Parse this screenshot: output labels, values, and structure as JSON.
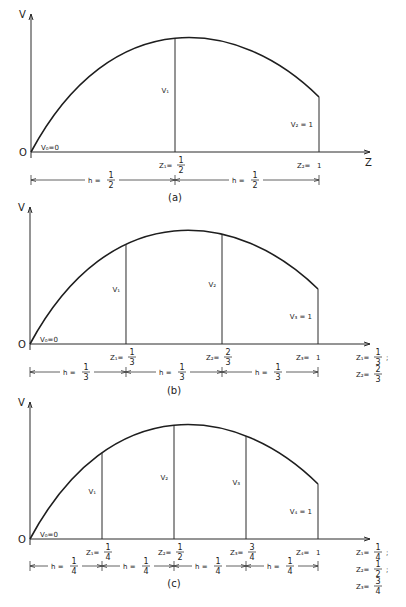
{
  "figure": {
    "caption": "",
    "panels": [
      {
        "id": "a",
        "label": "(a)",
        "axis_y_label": "V",
        "axis_x_label": "Z",
        "origin_label": "O",
        "v0_label": "V₀=0",
        "divisions": 2,
        "ordinates": [
          {
            "label": "V₁",
            "z": 0.5
          },
          {
            "label": "V₂ = 1",
            "z": 1.0
          }
        ],
        "z_labels": [
          {
            "name": "Z₁",
            "num": "1",
            "den": "2",
            "z": 0.5
          },
          {
            "name": "Z₂",
            "value": "1",
            "z": 1.0
          }
        ],
        "h_label": {
          "name": "h",
          "num": "1",
          "den": "2"
        },
        "side_note": []
      },
      {
        "id": "b",
        "label": "(b)",
        "axis_y_label": "V",
        "axis_x_label": "",
        "origin_label": "O",
        "v0_label": "V₀=0",
        "divisions": 3,
        "ordinates": [
          {
            "label": "V₁",
            "z": 0.3333
          },
          {
            "label": "V₂",
            "z": 0.6667
          },
          {
            "label": "V₃ = 1",
            "z": 1.0
          }
        ],
        "z_labels": [
          {
            "name": "Z₁",
            "num": "1",
            "den": "3",
            "z": 0.3333
          },
          {
            "name": "Z₂",
            "num": "2",
            "den": "3",
            "z": 0.6667
          },
          {
            "name": "Z₃",
            "value": "1",
            "z": 1.0
          }
        ],
        "h_label": {
          "name": "h",
          "num": "1",
          "den": "3"
        },
        "side_note": [
          {
            "name": "Z₁",
            "num": "1",
            "den": "3",
            "sep": ";"
          },
          {
            "name": "Z₂",
            "num": "2",
            "den": "3",
            "sep": ""
          }
        ]
      },
      {
        "id": "c",
        "label": "(c)",
        "axis_y_label": "V",
        "axis_x_label": "",
        "origin_label": "O",
        "v0_label": "V₀=0",
        "divisions": 4,
        "ordinates": [
          {
            "label": "V₁",
            "z": 0.25
          },
          {
            "label": "V₂",
            "z": 0.5
          },
          {
            "label": "V₃",
            "z": 0.75
          },
          {
            "label": "V₄ = 1",
            "z": 1.0
          }
        ],
        "z_labels": [
          {
            "name": "Z₁",
            "num": "1",
            "den": "4",
            "z": 0.25
          },
          {
            "name": "Z₂",
            "num": "1",
            "den": "2",
            "z": 0.5
          },
          {
            "name": "Z₃",
            "num": "3",
            "den": "4",
            "z": 0.75
          },
          {
            "name": "Z₄",
            "value": "1",
            "z": 1.0
          }
        ],
        "h_label": {
          "name": "h",
          "num": "1",
          "den": "4"
        },
        "side_note": [
          {
            "name": "Z₁",
            "num": "1",
            "den": "4",
            "sep": ";"
          },
          {
            "name": "Z₂",
            "num": "1",
            "den": "2",
            "sep": ";"
          },
          {
            "name": "Z₃",
            "num": "3",
            "den": "4",
            "sep": ""
          }
        ]
      }
    ],
    "curve_shape": "concave arc from V0 at Z=0 rising to a maximum near Z=0.5 and falling to V=1 at Z=1"
  }
}
